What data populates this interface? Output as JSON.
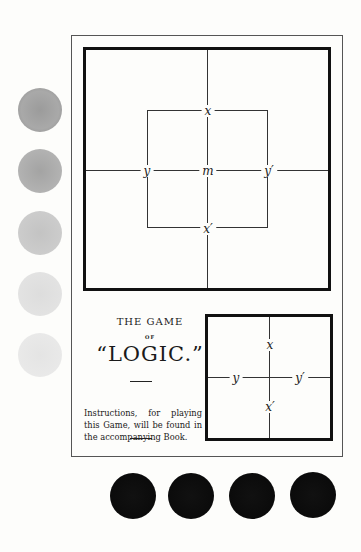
{
  "title": {
    "line1": "THE GAME",
    "line2": "OF",
    "line3": "“LOGIC.”"
  },
  "instructions": "Instructions, for playing this Game, will be found in the accompanying Book.",
  "big_board": {
    "labels": {
      "top": "x",
      "left": "y",
      "center": "m",
      "right": "y′",
      "bottom": "x′"
    }
  },
  "small_board": {
    "labels": {
      "top": "x",
      "left": "y",
      "right": "y′",
      "bottom": "x′"
    }
  },
  "counters": {
    "grey": {
      "count": 5,
      "color": "#9a9a9a"
    },
    "black": {
      "count": 4,
      "color": "#111111"
    }
  }
}
